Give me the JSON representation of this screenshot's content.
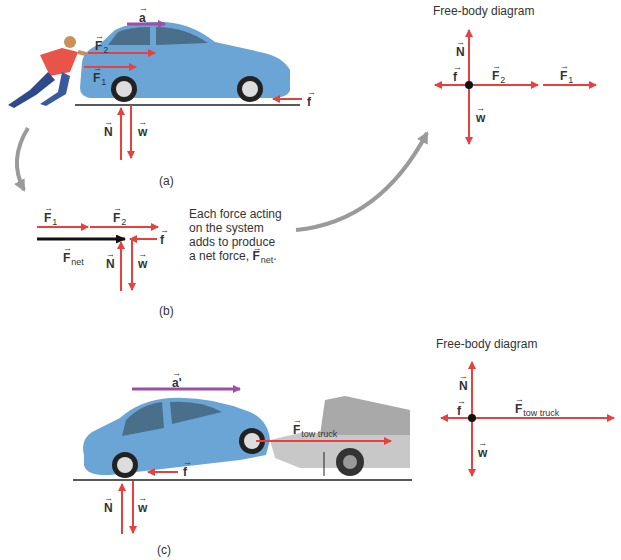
{
  "colors": {
    "force": "#e8403f",
    "acceleration": "#9b4fa8",
    "net_force": "#111111",
    "ground": "#222222",
    "flow_arrow": "#9a9a9a",
    "car_body": "#6aa5d6"
  },
  "panel_a": {
    "caption": "(a)",
    "labels": {
      "a": "a",
      "F2": "F",
      "F2_sub": "2",
      "F1": "F",
      "F1_sub": "1",
      "f": "f",
      "N": "N",
      "w": "w"
    }
  },
  "fbd_a": {
    "title": "Free-body diagram",
    "labels": {
      "N": "N",
      "f": "f",
      "w": "w",
      "F2": "F",
      "F2_sub": "2",
      "F1": "F",
      "F1_sub": "1"
    }
  },
  "panel_b": {
    "caption": "(b)",
    "labels": {
      "F1": "F",
      "F1_sub": "1",
      "F2": "F",
      "F2_sub": "2",
      "Fnet": "F",
      "Fnet_sub": "net",
      "f": "f",
      "N": "N",
      "w": "w"
    },
    "description_lines": [
      "Each force acting",
      "on the system",
      "adds to produce",
      "a net force, "
    ],
    "description_vec": "F",
    "description_vec_sub": "net",
    "description_end": "."
  },
  "panel_c": {
    "caption": "(c)",
    "labels": {
      "a_prime": "a'",
      "Ftow": "F",
      "Ftow_sub": "tow truck",
      "f": "f",
      "N": "N",
      "w": "w"
    }
  },
  "fbd_c": {
    "title": "Free-body diagram",
    "labels": {
      "N": "N",
      "f": "f",
      "w": "w",
      "Ftow": "F",
      "Ftow_sub": "tow truck"
    }
  }
}
